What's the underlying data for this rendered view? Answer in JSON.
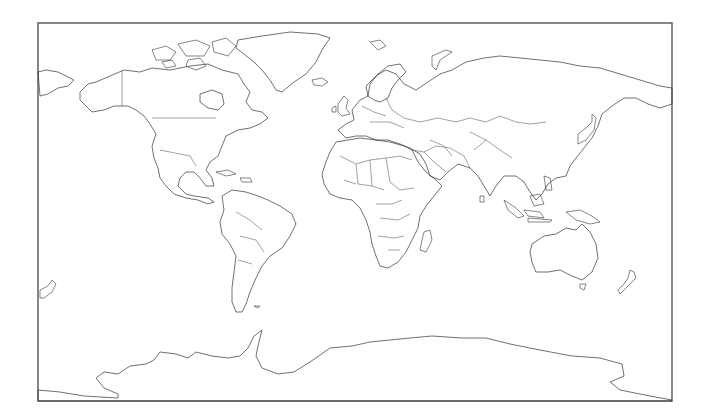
{
  "map": {
    "title": "",
    "projection": "Miller cylindrical",
    "style": "outline",
    "colors": {
      "background": "#ffffff",
      "outline": "#333333",
      "frame": "#555555"
    },
    "regions": [
      {
        "id": "north-america",
        "name": "North America"
      },
      {
        "id": "greenland",
        "name": "Greenland"
      },
      {
        "id": "south-america",
        "name": "South America"
      },
      {
        "id": "europe",
        "name": "Europe"
      },
      {
        "id": "africa",
        "name": "Africa"
      },
      {
        "id": "asia",
        "name": "Asia"
      },
      {
        "id": "australia",
        "name": "Australia"
      },
      {
        "id": "antarctica",
        "name": "Antarctica"
      },
      {
        "id": "madagascar",
        "name": "Madagascar"
      },
      {
        "id": "new-zealand",
        "name": "New Zealand"
      },
      {
        "id": "japan",
        "name": "Japan"
      },
      {
        "id": "uk",
        "name": "United Kingdom"
      },
      {
        "id": "iceland",
        "name": "Iceland"
      },
      {
        "id": "indonesia",
        "name": "Indonesia"
      },
      {
        "id": "new-guinea",
        "name": "New Guinea"
      },
      {
        "id": "philippines",
        "name": "Philippines"
      },
      {
        "id": "caribbean",
        "name": "Caribbean"
      },
      {
        "id": "arctic-islands",
        "name": "Arctic Archipelago"
      },
      {
        "id": "svalbard",
        "name": "Svalbard"
      },
      {
        "id": "novaya-zemlya",
        "name": "Novaya Zemlya"
      },
      {
        "id": "sri-lanka",
        "name": "Sri Lanka"
      },
      {
        "id": "falklands",
        "name": "Falkland Islands"
      }
    ]
  }
}
